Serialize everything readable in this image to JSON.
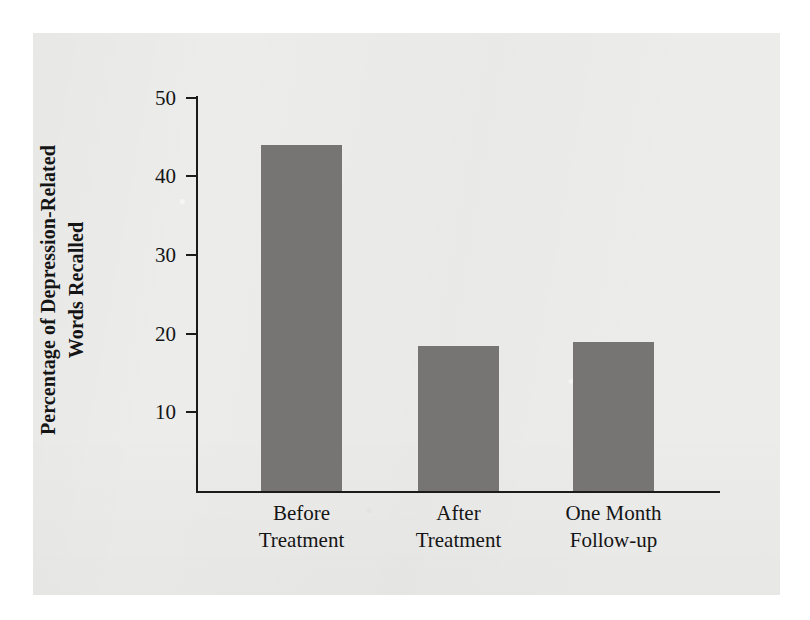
{
  "figure": {
    "background_color": "#ffffff",
    "page_color": "#ececeb",
    "ink_color": "#1b1b1b",
    "bar_color": "#767574"
  },
  "chart_data": {
    "type": "bar",
    "title": "",
    "subtitle": "",
    "xlabel": "",
    "ylabel": "Percentage of Depression-Related Words Recalled",
    "ylabel_line1": "Percentage of Depression-Related",
    "ylabel_line2": "Words Recalled",
    "categories": [
      "Before Treatment",
      "After Treatment",
      "One Month Follow-up"
    ],
    "category_lines": [
      [
        "Before",
        "Treatment"
      ],
      [
        "After",
        "Treatment"
      ],
      [
        "One Month",
        "Follow-up"
      ]
    ],
    "values": [
      44,
      18.5,
      19
    ],
    "ylim": [
      0,
      50
    ],
    "yticks": [
      10,
      20,
      30,
      40,
      50
    ],
    "ytick_labels": [
      "10",
      "20",
      "30",
      "40",
      "50"
    ],
    "grid": false,
    "legend": false,
    "legend_position": "none",
    "series": [
      {
        "name": "Percentage of Depression-Related Words Recalled",
        "values": [
          44,
          18.5,
          19
        ],
        "color": "#767574"
      }
    ]
  }
}
